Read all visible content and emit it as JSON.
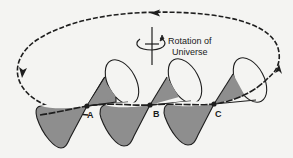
{
  "diagram": {
    "annotation": {
      "line1": "Rotation of",
      "line2": "Universe"
    },
    "points": [
      {
        "label": "A"
      },
      {
        "label": "B"
      },
      {
        "label": "C"
      }
    ],
    "colors": {
      "background": "#f4f4f2",
      "stroke": "#1e1e1e",
      "cone_fill": "#8e8e8e",
      "cone_fill_light": "#a5a5a5"
    },
    "elements": [
      "dashed closed orbit with direction arrows",
      "rotation axis symbol with curved arrow",
      "three tilted double light cones at points A, B, C on the path"
    ]
  }
}
